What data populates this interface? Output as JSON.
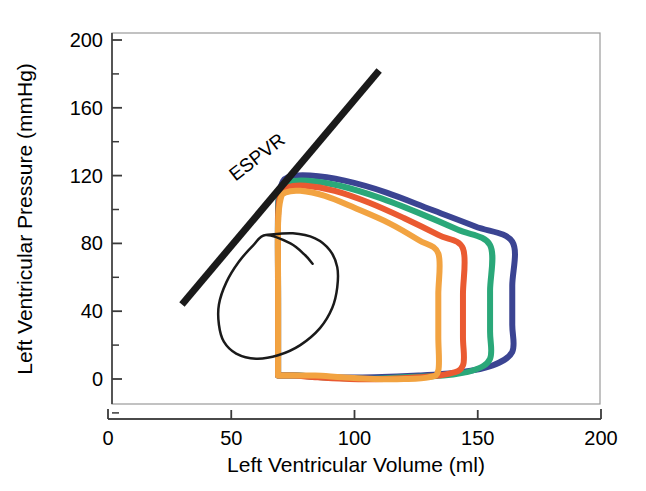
{
  "chart_data": {
    "type": "line",
    "title": "",
    "xlabel": "Left Ventricular Volume (ml)",
    "ylabel": "Left Ventricular Pressure (mmHg)",
    "xlim": [
      0,
      200
    ],
    "ylim": [
      0,
      200
    ],
    "xticks": [
      0,
      50,
      100,
      150,
      200
    ],
    "xtick_labels": [
      "0",
      "50",
      "100",
      "150",
      "200"
    ],
    "yticks": [
      0,
      40,
      80,
      120,
      160,
      200
    ],
    "ytick_labels": [
      "0",
      "40",
      "80",
      "120",
      "160",
      "200"
    ],
    "minor_tick_step": 20,
    "grid": false,
    "legend": "none",
    "annotations": [
      {
        "name": "espvr-label",
        "text": "ESPVR",
        "x": 62,
        "y": 128,
        "rotation": -38
      }
    ],
    "series": [
      {
        "name": "ESPVR line",
        "color": "#1a1a1a",
        "width": 7,
        "type": "line",
        "points": [
          [
            30,
            44
          ],
          [
            110,
            182
          ]
        ]
      },
      {
        "name": "Baseline PV loop (black)",
        "color": "#1a1a1a",
        "width": 2.5,
        "type": "loop",
        "points": [
          [
            64,
            85
          ],
          [
            75,
            86
          ],
          [
            84,
            83
          ],
          [
            90,
            76
          ],
          [
            93,
            66
          ],
          [
            93,
            54
          ],
          [
            91,
            42
          ],
          [
            86,
            30
          ],
          [
            78,
            20
          ],
          [
            69,
            14
          ],
          [
            60,
            12
          ],
          [
            52,
            15
          ],
          [
            47,
            22
          ],
          [
            45,
            32
          ],
          [
            45,
            44
          ],
          [
            48,
            57
          ],
          [
            53,
            69
          ],
          [
            59,
            79
          ],
          [
            64,
            85
          ],
          [
            74,
            80
          ],
          [
            80,
            73
          ],
          [
            83,
            68
          ]
        ]
      },
      {
        "name": "Loop 1 (orange)",
        "color": "#f2a341",
        "width": 6,
        "type": "loop",
        "end_systolic_volume": 69,
        "end_diastolic_volume": 134,
        "peak_pressure": 110,
        "points": [
          [
            69,
            2
          ],
          [
            69,
            20
          ],
          [
            69,
            55
          ],
          [
            69,
            92
          ],
          [
            70,
            106
          ],
          [
            72,
            110
          ],
          [
            78,
            111
          ],
          [
            88,
            108
          ],
          [
            100,
            101
          ],
          [
            114,
            92
          ],
          [
            126,
            82
          ],
          [
            134,
            74
          ],
          [
            134,
            50
          ],
          [
            134,
            25
          ],
          [
            134,
            5
          ],
          [
            130,
            1
          ],
          [
            120,
            0
          ],
          [
            108,
            0
          ],
          [
            95,
            1
          ],
          [
            84,
            2
          ],
          [
            75,
            2
          ],
          [
            69,
            2
          ]
        ]
      },
      {
        "name": "Loop 2 (red-orange)",
        "color": "#ea5a31",
        "width": 6,
        "type": "loop",
        "end_systolic_volume": 69,
        "end_diastolic_volume": 144,
        "peak_pressure": 113,
        "points": [
          [
            69,
            2
          ],
          [
            69,
            40
          ],
          [
            69,
            95
          ],
          [
            70,
            108
          ],
          [
            73,
            113
          ],
          [
            80,
            114
          ],
          [
            92,
            111
          ],
          [
            106,
            104
          ],
          [
            120,
            95
          ],
          [
            134,
            85
          ],
          [
            144,
            77
          ],
          [
            144,
            50
          ],
          [
            144,
            25
          ],
          [
            144,
            8
          ],
          [
            138,
            3
          ],
          [
            126,
            1
          ],
          [
            112,
            0
          ],
          [
            98,
            0
          ],
          [
            85,
            1
          ],
          [
            75,
            2
          ],
          [
            69,
            2
          ]
        ]
      },
      {
        "name": "Loop 3 (green)",
        "color": "#2aa879",
        "width": 6,
        "type": "loop",
        "end_systolic_volume": 69,
        "end_diastolic_volume": 155,
        "peak_pressure": 116,
        "points": [
          [
            69,
            2
          ],
          [
            69,
            45
          ],
          [
            69,
            98
          ],
          [
            70,
            111
          ],
          [
            73,
            116
          ],
          [
            81,
            117
          ],
          [
            94,
            114
          ],
          [
            110,
            107
          ],
          [
            126,
            98
          ],
          [
            142,
            88
          ],
          [
            155,
            79
          ],
          [
            155,
            52
          ],
          [
            155,
            28
          ],
          [
            155,
            12
          ],
          [
            148,
            5
          ],
          [
            136,
            2
          ],
          [
            120,
            1
          ],
          [
            104,
            0
          ],
          [
            88,
            1
          ],
          [
            76,
            2
          ],
          [
            69,
            2
          ]
        ]
      },
      {
        "name": "Loop 4 (blue)",
        "color": "#3b4492",
        "width": 6,
        "type": "loop",
        "end_systolic_volume": 69,
        "end_diastolic_volume": 164,
        "peak_pressure": 119,
        "points": [
          [
            69,
            2
          ],
          [
            69,
            48
          ],
          [
            69,
            100
          ],
          [
            70,
            113
          ],
          [
            73,
            119
          ],
          [
            82,
            120
          ],
          [
            96,
            117
          ],
          [
            113,
            110
          ],
          [
            131,
            100
          ],
          [
            149,
            90
          ],
          [
            164,
            81
          ],
          [
            164,
            55
          ],
          [
            164,
            32
          ],
          [
            164,
            16
          ],
          [
            156,
            8
          ],
          [
            143,
            4
          ],
          [
            126,
            2
          ],
          [
            108,
            1
          ],
          [
            90,
            1
          ],
          [
            77,
            2
          ],
          [
            69,
            2
          ]
        ]
      }
    ]
  },
  "figure": {
    "background_color": "#ffffff",
    "axis_color": "#555555",
    "text_color": "#000000"
  }
}
